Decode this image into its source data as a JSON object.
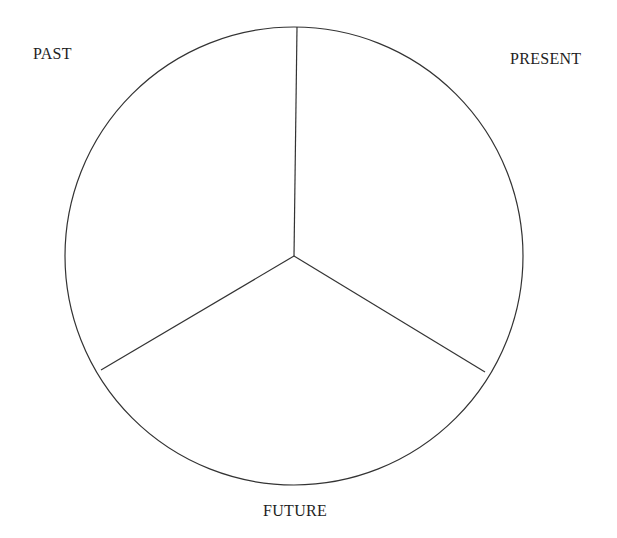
{
  "diagram": {
    "type": "circle divided into three sectors",
    "labels": {
      "past": "PAST",
      "present": "PRESENT",
      "future": "FUTURE"
    },
    "colors": {
      "stroke": "#333333",
      "text": "#1e1e1e",
      "background": "#ffffff"
    },
    "geometry": {
      "center": [
        294,
        256
      ],
      "radius": 229,
      "spokes": [
        {
          "name": "top",
          "end": [
            297,
            27
          ]
        },
        {
          "name": "lower-left",
          "end": [
            101,
            370
          ]
        },
        {
          "name": "lower-right",
          "end": [
            485,
            372
          ]
        }
      ]
    }
  }
}
